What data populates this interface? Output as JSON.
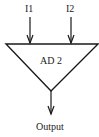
{
  "diagram": {
    "block": {
      "label": "AD 2",
      "shape": "inverted-triangle"
    },
    "inputs": [
      {
        "label": "I1"
      },
      {
        "label": "I2"
      }
    ],
    "output": {
      "label": "Output"
    },
    "colors": {
      "stroke": "#1a1a1a",
      "background": "#ffffff"
    }
  }
}
